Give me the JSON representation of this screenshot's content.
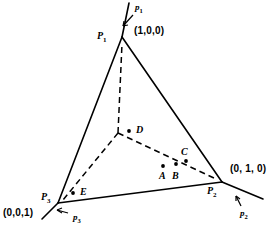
{
  "figure": {
    "width": 280,
    "height": 234,
    "background": "#ffffff",
    "line_color": "#000000"
  },
  "vertices": [
    {
      "id": "P1",
      "name": "P",
      "subscript": "1",
      "coord_label": "(1,0,0)",
      "x": 122,
      "y": 37,
      "name_x": 100,
      "name_y": 30,
      "coord_x": 134,
      "coord_y": 27
    },
    {
      "id": "P2",
      "name": "P",
      "subscript": "2",
      "coord_label": "(0, 1, 0)",
      "x": 222,
      "y": 182,
      "name_x": 210,
      "name_y": 186,
      "coord_x": 231,
      "coord_y": 166
    },
    {
      "id": "P3",
      "name": "P",
      "subscript": "3",
      "coord_label": "(0,0,1)",
      "x": 58,
      "y": 203,
      "name_x": 44,
      "name_y": 195,
      "coord_x": 4,
      "coord_y": 209
    }
  ],
  "axes": [
    {
      "id": "p1",
      "name": "p",
      "subscript": "1",
      "label_x": 134,
      "label_y": 4
    },
    {
      "id": "p2",
      "name": "p",
      "subscript": "2",
      "label_x": 240,
      "label_y": 212
    },
    {
      "id": "p3",
      "name": "p",
      "subscript": "3",
      "label_x": 72,
      "label_y": 216
    }
  ],
  "interior_points": [
    {
      "id": "D",
      "name": "D",
      "dot_x": 129,
      "dot_y": 131,
      "label_x": 136,
      "label_y": 126
    },
    {
      "id": "C",
      "name": "C",
      "dot_x": 186,
      "dot_y": 161,
      "label_x": 182,
      "label_y": 148
    },
    {
      "id": "A",
      "name": "A",
      "dot_x": 163,
      "dot_y": 166,
      "label_x": 159,
      "label_y": 172
    },
    {
      "id": "B",
      "name": "B",
      "dot_x": 176,
      "dot_y": 164,
      "label_x": 172,
      "label_y": 172
    },
    {
      "id": "E",
      "name": "E",
      "dot_x": 73,
      "dot_y": 193,
      "label_x": 80,
      "label_y": 188
    }
  ],
  "centroid": {
    "x": 118,
    "y": 133
  }
}
